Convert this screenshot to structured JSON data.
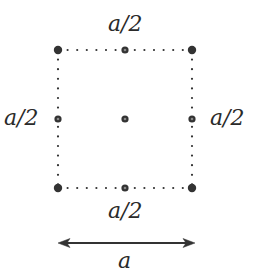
{
  "diagram": {
    "type": "lattice-unit-cell",
    "colors": {
      "background": "#ffffff",
      "dot": "#333333",
      "line": "#333333",
      "text": "#2a2a2a"
    },
    "square": {
      "left": 58,
      "top": 50,
      "right": 192,
      "bottom": 188,
      "style": "dotted"
    },
    "points": [
      {
        "name": "corner-top-left",
        "x": 58,
        "y": 50
      },
      {
        "name": "midpoint-top",
        "x": 125,
        "y": 50
      },
      {
        "name": "corner-top-right",
        "x": 192,
        "y": 50
      },
      {
        "name": "midpoint-left",
        "x": 58,
        "y": 119
      },
      {
        "name": "center",
        "x": 125,
        "y": 119
      },
      {
        "name": "midpoint-right",
        "x": 192,
        "y": 119
      },
      {
        "name": "corner-bottom-left",
        "x": 58,
        "y": 188
      },
      {
        "name": "midpoint-bottom",
        "x": 125,
        "y": 188
      },
      {
        "name": "corner-bottom-right",
        "x": 192,
        "y": 188
      }
    ],
    "labels": {
      "top": "a/2",
      "left": "a/2",
      "right": "a/2",
      "bottom": "a/2",
      "length": "a"
    },
    "arrow": {
      "x1": 59,
      "x2": 194,
      "y": 243,
      "double_headed": true
    }
  }
}
